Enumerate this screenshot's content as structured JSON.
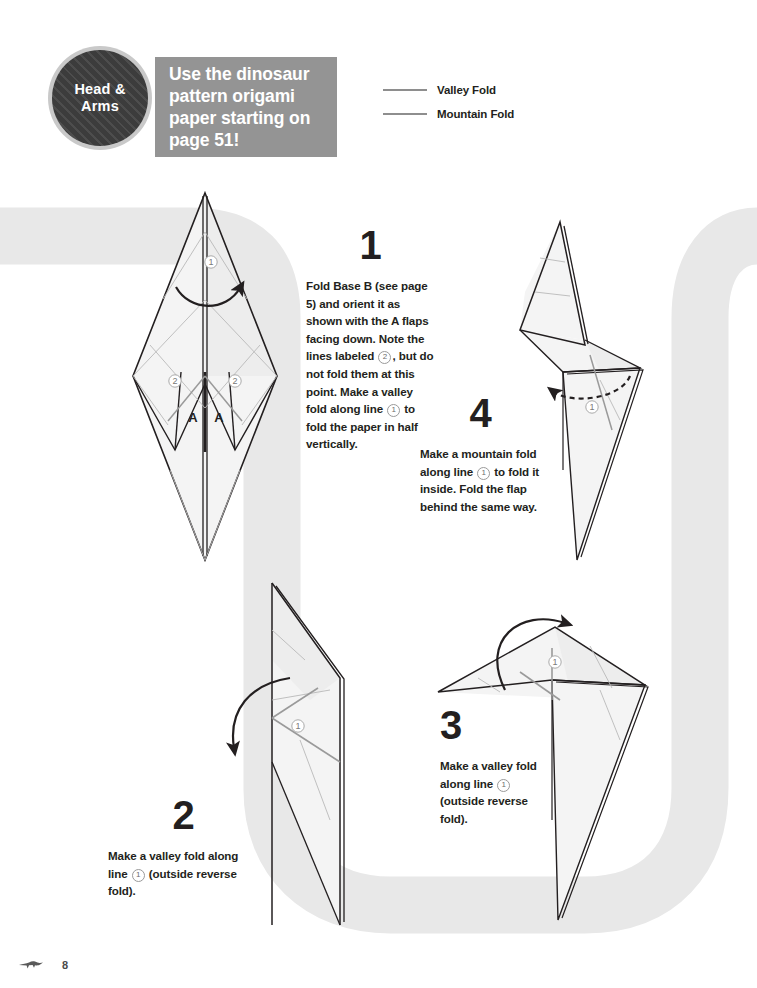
{
  "page": {
    "number": "8",
    "footer_icon": "dinosaur-icon",
    "background_shape": "u-shaped-path",
    "background_color": "#e8e8e8"
  },
  "header": {
    "badge": {
      "label": "Head &\nArms",
      "icon": "striped-circle-badge",
      "fill": "#3c3c3c",
      "ring": "#c9c9c9"
    },
    "promo": {
      "text": "Use the dinosaur pattern origami paper starting on page 51!",
      "background": "#949494",
      "text_color": "#ffffff"
    },
    "legend": {
      "items": [
        {
          "label": "Valley Fold",
          "style": "solid",
          "color": "#8e8e8e"
        },
        {
          "label": "Mountain Fold",
          "style": "solid",
          "color": "#8e8e8e"
        }
      ]
    }
  },
  "steps": [
    {
      "number": "1",
      "text_parts": [
        "Fold Base B (see page 5) and orient it as shown with the A flaps facing down. Note the lines labeled ",
        "2",
        ", but do not fold them at this point. Make a valley fold along line ",
        "1",
        " to fold the paper in half vertically."
      ],
      "diagram": {
        "name": "base-b-diamond",
        "markers": [
          "1",
          "2",
          "2"
        ],
        "flap_labels": [
          "A",
          "A"
        ],
        "arrow": "valley-fold-curved-arrow-solid"
      }
    },
    {
      "number": "2",
      "text_parts": [
        "Make a valley fold along line ",
        "1",
        " (outside reverse fold)."
      ],
      "diagram": {
        "name": "folded-half-shape",
        "markers": [
          "1"
        ],
        "arrow": "valley-fold-curved-arrow-solid"
      }
    },
    {
      "number": "3",
      "text_parts": [
        "Make a valley fold along line ",
        "1",
        " (outside reverse fold)."
      ],
      "diagram": {
        "name": "rotated-head-shape",
        "markers": [
          "1"
        ],
        "arrow": "valley-fold-loop-arrow-solid"
      }
    },
    {
      "number": "4",
      "text_parts": [
        "Make a mountain fold along line ",
        "1",
        " to fold it inside. Fold the flap behind the same way."
      ],
      "diagram": {
        "name": "head-and-arms-shape",
        "markers": [
          "1"
        ],
        "arrow": "mountain-fold-dashed-arrow"
      }
    }
  ]
}
